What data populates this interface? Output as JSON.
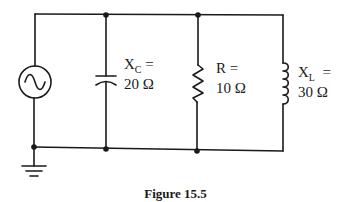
{
  "figure": {
    "caption": "Figure 15.5"
  },
  "components": {
    "source": {
      "type": "AC voltage source",
      "icon": "ac-source-icon"
    },
    "capacitor": {
      "symbol": "X",
      "subscript": "C",
      "equals": "=",
      "value": "20 Ω"
    },
    "resistor": {
      "symbol": "R",
      "equals": "=",
      "value": "10 Ω"
    },
    "inductor": {
      "symbol": "X",
      "subscript": "L",
      "equals": "=",
      "value": "30 Ω"
    },
    "ground": {
      "icon": "ground-icon"
    }
  },
  "colors": {
    "wire": "#1a1a1a",
    "background": "#ffffff"
  }
}
